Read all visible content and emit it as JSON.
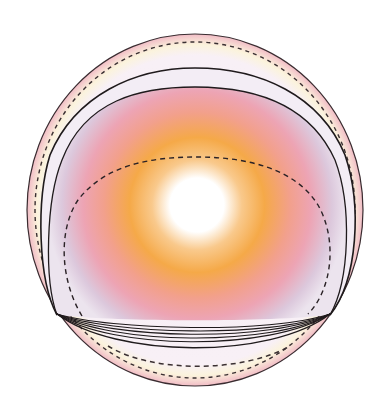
{
  "diagram": {
    "type": "concentric-shell-illustration",
    "colors": {
      "background": "#ffffff",
      "outer_rim": "#f3c4cc",
      "shell_band": "#f4eef6",
      "cream_band": "#fbf3dc",
      "haze_lavender": "#d9c9dc",
      "haze_pink": "#f0a3ab",
      "core_orange": "#f5a948",
      "core_white": "#ffffff",
      "line_dark": "#2a2226"
    },
    "center": {
      "x": 197,
      "y": 205
    },
    "outer_boundary": {
      "cx": 195,
      "cy": 210,
      "rx": 168,
      "ry": 176
    },
    "layers": [
      {
        "name": "outer-rim",
        "style": "solid"
      },
      {
        "name": "outer-dashed-ring",
        "style": "dashed"
      },
      {
        "name": "shell-arc-1",
        "style": "solid"
      },
      {
        "name": "shell-arc-2",
        "style": "solid"
      },
      {
        "name": "inner-dashed-arc",
        "style": "dashed"
      },
      {
        "name": "bottom-stacked-curves",
        "style": "solid",
        "count": 6
      },
      {
        "name": "bottom-dashed-arc",
        "style": "dashed"
      }
    ]
  }
}
